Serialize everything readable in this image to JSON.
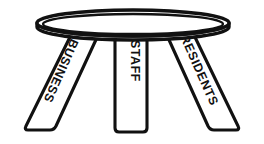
{
  "figure": {
    "name": "three-legged-stool-diagram",
    "background_color": "#ffffff",
    "line_color": "#111111",
    "fill_color": "#ffffff",
    "style": "black-and-white line art"
  },
  "seat": {
    "label": "stool seat",
    "shape": "ellipse with thick rim"
  },
  "legs": [
    {
      "id": "left-leg",
      "label": "BUSINESS",
      "position": "left",
      "orientation": "slanted outward to the lower left",
      "text_direction": "vertical, reading downward",
      "letters": [
        "B",
        "U",
        "S",
        "I",
        "N",
        "E",
        "S",
        "S"
      ]
    },
    {
      "id": "center-leg",
      "label": "STAFF",
      "position": "center",
      "orientation": "vertical",
      "text_direction": "vertical, reading downward",
      "letters": [
        "S",
        "T",
        "A",
        "F",
        "F"
      ]
    },
    {
      "id": "right-leg",
      "label": "RESIDENTS",
      "position": "right",
      "orientation": "slanted outward to the lower right",
      "text_direction": "vertical, reading downward",
      "letters": [
        "R",
        "E",
        "S",
        "I",
        "D",
        "E",
        "N",
        "T",
        "S"
      ]
    }
  ]
}
